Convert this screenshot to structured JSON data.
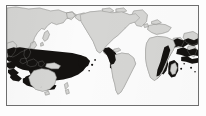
{
  "figure": {
    "kind": "world-distribution-map",
    "title": "",
    "caption": "",
    "projection": "pacific-centred equirectangular",
    "frame": {
      "visible": true,
      "border_color": "#6e6e6e",
      "border_width_px": 1
    },
    "colors": {
      "ocean": "#fbfbfb",
      "land": "#d5d5d3",
      "land_outline": "#9a9a98",
      "range_shading": "#141210",
      "page_background": "#fdfdfd"
    },
    "legend": {
      "visible": false,
      "entries": [
        {
          "swatch_color": "#141210",
          "label": ""
        }
      ]
    },
    "landmasses": [
      {
        "name": "asia-siberia"
      },
      {
        "name": "north-america"
      },
      {
        "name": "greenland"
      },
      {
        "name": "south-america"
      },
      {
        "name": "africa"
      },
      {
        "name": "europe"
      },
      {
        "name": "australia"
      },
      {
        "name": "new-guinea"
      },
      {
        "name": "madagascar"
      },
      {
        "name": "new-zealand"
      },
      {
        "name": "japan"
      },
      {
        "name": "indonesia-archipelago"
      }
    ],
    "range_regions": [
      {
        "name": "indo-west-pacific-core"
      },
      {
        "name": "central-pacific-extension"
      },
      {
        "name": "eastern-pacific-central-america"
      },
      {
        "name": "western-indian-ocean-east-africa"
      },
      {
        "name": "south-west-indian-ocean-madagascar"
      },
      {
        "name": "eastern-atlantic-fringe"
      }
    ],
    "axis_labels": {
      "x": "",
      "y": ""
    },
    "tick_labels": []
  }
}
